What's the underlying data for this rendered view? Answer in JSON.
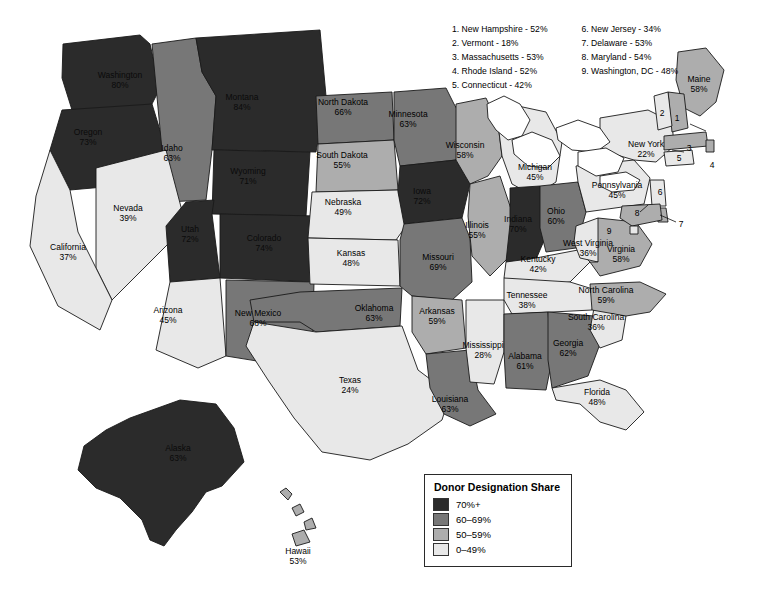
{
  "title": "Donor Designation Share",
  "legend": {
    "title": "Donor Designation Share",
    "items": [
      {
        "label": "70%+",
        "color": "#2b2b2b",
        "bucket": "c70"
      },
      {
        "label": "60–69%",
        "color": "#777777",
        "bucket": "c60"
      },
      {
        "label": "50–59%",
        "color": "#adadad",
        "bucket": "c50"
      },
      {
        "label": "0–49%",
        "color": "#e8e8e8",
        "bucket": "c0"
      }
    ]
  },
  "northeast_list": {
    "column1": [
      "1. New Hampshire - 52%",
      "2. Vermont - 18%",
      "3. Massachusetts - 53%",
      "4. Rhode Island - 52%",
      "5. Connecticut - 42%"
    ],
    "column2": [
      "6. New Jersey - 34%",
      "7. Delaware - 53%",
      "8. Maryland - 54%",
      "9. Washington, DC - 48%"
    ]
  },
  "callout_numbers": [
    "1",
    "2",
    "3",
    "4",
    "5",
    "6",
    "7",
    "8",
    "9"
  ],
  "chart_data": {
    "type": "map",
    "title": "Donor Designation Share",
    "measure": "Donor Designation Share (percent)",
    "buckets": [
      "70%+",
      "60–69%",
      "50–59%",
      "0–49%"
    ],
    "states": [
      {
        "name": "Washington",
        "value": 80,
        "label": "Washington",
        "pct": "80%",
        "bucket": "c70",
        "lx": 120,
        "ly": 80
      },
      {
        "name": "Oregon",
        "value": 73,
        "label": "Oregon",
        "pct": "73%",
        "bucket": "c70",
        "lx": 88,
        "ly": 137
      },
      {
        "name": "Idaho",
        "value": 63,
        "label": "Idaho",
        "pct": "63%",
        "bucket": "c60",
        "lx": 172,
        "ly": 153
      },
      {
        "name": "Montana",
        "value": 84,
        "label": "Montana",
        "pct": "84%",
        "bucket": "c70",
        "lx": 242,
        "ly": 102
      },
      {
        "name": "Wyoming",
        "value": 71,
        "label": "Wyoming",
        "pct": "71%",
        "bucket": "c70",
        "lx": 248,
        "ly": 176
      },
      {
        "name": "Nevada",
        "value": 39,
        "label": "Nevada",
        "pct": "39%",
        "bucket": "c0",
        "lx": 128,
        "ly": 213
      },
      {
        "name": "Utah",
        "value": 72,
        "label": "Utah",
        "pct": "72%",
        "bucket": "c70",
        "lx": 190,
        "ly": 234
      },
      {
        "name": "California",
        "value": 37,
        "label": "California",
        "pct": "37%",
        "bucket": "c0",
        "lx": 68,
        "ly": 252
      },
      {
        "name": "Arizona",
        "value": 45,
        "label": "Arizona",
        "pct": "45%",
        "bucket": "c0",
        "lx": 168,
        "ly": 315
      },
      {
        "name": "Colorado",
        "value": 74,
        "label": "Colorado",
        "pct": "74%",
        "bucket": "c70",
        "lx": 264,
        "ly": 243
      },
      {
        "name": "New Mexico",
        "value": 68,
        "label": "New Mexico",
        "pct": "68%",
        "bucket": "c60",
        "lx": 258,
        "ly": 318
      },
      {
        "name": "North Dakota",
        "value": 66,
        "label": "North Dakota",
        "pct": "66%",
        "bucket": "c60",
        "lx": 343,
        "ly": 107
      },
      {
        "name": "South Dakota",
        "value": 55,
        "label": "South Dakota",
        "pct": "55%",
        "bucket": "c50",
        "lx": 342,
        "ly": 160
      },
      {
        "name": "Nebraska",
        "value": 49,
        "label": "Nebraska",
        "pct": "49%",
        "bucket": "c0",
        "lx": 343,
        "ly": 207
      },
      {
        "name": "Kansas",
        "value": 48,
        "label": "Kansas",
        "pct": "48%",
        "bucket": "c0",
        "lx": 351,
        "ly": 258
      },
      {
        "name": "Oklahoma",
        "value": 63,
        "label": "Oklahoma",
        "pct": "63%",
        "bucket": "c60",
        "lx": 374,
        "ly": 313
      },
      {
        "name": "Texas",
        "value": 24,
        "label": "Texas",
        "pct": "24%",
        "bucket": "c0",
        "lx": 350,
        "ly": 385
      },
      {
        "name": "Minnesota",
        "value": 63,
        "label": "Minnesota",
        "pct": "63%",
        "bucket": "c60",
        "lx": 408,
        "ly": 119
      },
      {
        "name": "Iowa",
        "value": 72,
        "label": "Iowa",
        "pct": "72%",
        "bucket": "c70",
        "lx": 422,
        "ly": 196
      },
      {
        "name": "Missouri",
        "value": 69,
        "label": "Missouri",
        "pct": "69%",
        "bucket": "c60",
        "lx": 438,
        "ly": 262
      },
      {
        "name": "Arkansas",
        "value": 59,
        "label": "Arkansas",
        "pct": "59%",
        "bucket": "c50",
        "lx": 437,
        "ly": 316
      },
      {
        "name": "Louisiana",
        "value": 63,
        "label": "Louisiana",
        "pct": "63%",
        "bucket": "c60",
        "lx": 450,
        "ly": 404
      },
      {
        "name": "Wisconsin",
        "value": 58,
        "label": "Wisconsin",
        "pct": "58%",
        "bucket": "c50",
        "lx": 465,
        "ly": 150
      },
      {
        "name": "Illinois",
        "value": 55,
        "label": "Illinois",
        "pct": "55%",
        "bucket": "c50",
        "lx": 477,
        "ly": 230
      },
      {
        "name": "Mississippi",
        "value": 28,
        "label": "Mississippi",
        "pct": "28%",
        "bucket": "c0",
        "lx": 483,
        "ly": 350
      },
      {
        "name": "Michigan",
        "value": 45,
        "label": "Michigan",
        "pct": "45%",
        "bucket": "c0",
        "lx": 535,
        "ly": 172
      },
      {
        "name": "Indiana",
        "value": 70,
        "label": "Indiana",
        "pct": "70%",
        "bucket": "c70",
        "lx": 518,
        "ly": 224
      },
      {
        "name": "Ohio",
        "value": 60,
        "label": "Ohio",
        "pct": "60%",
        "bucket": "c60",
        "lx": 556,
        "ly": 216
      },
      {
        "name": "Kentucky",
        "value": 42,
        "label": "Kentucky",
        "pct": "42%",
        "bucket": "c0",
        "lx": 538,
        "ly": 264
      },
      {
        "name": "Tennessee",
        "value": 38,
        "label": "Tennessee",
        "pct": "38%",
        "bucket": "c0",
        "lx": 527,
        "ly": 300
      },
      {
        "name": "Alabama",
        "value": 61,
        "label": "Alabama",
        "pct": "61%",
        "bucket": "c60",
        "lx": 525,
        "ly": 361
      },
      {
        "name": "Georgia",
        "value": 62,
        "label": "Georgia",
        "pct": "62%",
        "bucket": "c60",
        "lx": 568,
        "ly": 348
      },
      {
        "name": "Florida",
        "value": 48,
        "label": "Florida",
        "pct": "48%",
        "bucket": "c0",
        "lx": 597,
        "ly": 397
      },
      {
        "name": "South Carolina",
        "value": 36,
        "label": "South Carolina",
        "pct": "36%",
        "bucket": "c0",
        "lx": 596,
        "ly": 322
      },
      {
        "name": "North Carolina",
        "value": 59,
        "label": "North Carolina",
        "pct": "59%",
        "bucket": "c50",
        "lx": 606,
        "ly": 295
      },
      {
        "name": "West Virginia",
        "value": 36,
        "label": "West Virginia",
        "pct": "36%",
        "bucket": "c0",
        "lx": 588,
        "ly": 248
      },
      {
        "name": "Virginia",
        "value": 58,
        "label": "Virginia",
        "pct": "58%",
        "bucket": "c50",
        "lx": 621,
        "ly": 254
      },
      {
        "name": "Pennsylvania",
        "value": 45,
        "label": "Pennsylvania",
        "pct": "45%",
        "bucket": "c0",
        "lx": 617,
        "ly": 190
      },
      {
        "name": "New York",
        "value": 22,
        "label": "New York",
        "pct": "22%",
        "bucket": "c0",
        "lx": 646,
        "ly": 149
      },
      {
        "name": "Maine",
        "value": 58,
        "label": "Maine",
        "pct": "58%",
        "bucket": "c50",
        "lx": 699,
        "ly": 84
      },
      {
        "name": "New Hampshire",
        "value": 52,
        "label": "",
        "pct": "",
        "bucket": "c50",
        "lx": 0,
        "ly": 0
      },
      {
        "name": "Vermont",
        "value": 18,
        "label": "",
        "pct": "",
        "bucket": "c0",
        "lx": 0,
        "ly": 0
      },
      {
        "name": "Massachusetts",
        "value": 53,
        "label": "",
        "pct": "",
        "bucket": "c50",
        "lx": 0,
        "ly": 0
      },
      {
        "name": "Rhode Island",
        "value": 52,
        "label": "",
        "pct": "",
        "bucket": "c50",
        "lx": 0,
        "ly": 0
      },
      {
        "name": "Connecticut",
        "value": 42,
        "label": "",
        "pct": "",
        "bucket": "c0",
        "lx": 0,
        "ly": 0
      },
      {
        "name": "New Jersey",
        "value": 34,
        "label": "",
        "pct": "",
        "bucket": "c0",
        "lx": 0,
        "ly": 0
      },
      {
        "name": "Delaware",
        "value": 53,
        "label": "",
        "pct": "",
        "bucket": "c50",
        "lx": 0,
        "ly": 0
      },
      {
        "name": "Maryland",
        "value": 54,
        "label": "",
        "pct": "",
        "bucket": "c50",
        "lx": 0,
        "ly": 0
      },
      {
        "name": "Washington, DC",
        "value": 48,
        "label": "",
        "pct": "",
        "bucket": "c0",
        "lx": 0,
        "ly": 0
      },
      {
        "name": "Alaska",
        "value": 63,
        "label": "Alaska",
        "pct": "63%",
        "bucket": "c70",
        "lx": 178,
        "ly": 453
      },
      {
        "name": "Hawaii",
        "value": 53,
        "label": "Hawaii",
        "pct": "53%",
        "bucket": "c50",
        "lx": 298,
        "ly": 556
      }
    ]
  }
}
